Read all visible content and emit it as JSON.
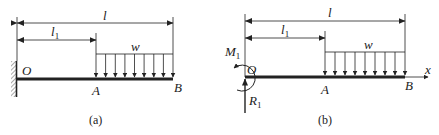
{
  "figure_a": {
    "caption": "(a)",
    "labels": {
      "total_length": "l",
      "partial_length_main": "l",
      "partial_length_sub": "1",
      "load": "w",
      "origin": "O",
      "point_a": "A",
      "point_b": "B"
    },
    "support": "fixed-wall",
    "load_arrow_count": 9
  },
  "figure_b": {
    "caption": "(b)",
    "labels": {
      "total_length": "l",
      "partial_length_main": "l",
      "partial_length_sub": "1",
      "load": "w",
      "origin": "O",
      "point_a": "A",
      "point_b": "B",
      "axis": "x",
      "moment_main": "M",
      "moment_sub": "1",
      "reaction_main": "R",
      "reaction_sub": "1"
    },
    "load_arrow_count": 9
  },
  "colors": {
    "ink": "#222222",
    "hatch": "#555555",
    "background": "#ffffff"
  }
}
